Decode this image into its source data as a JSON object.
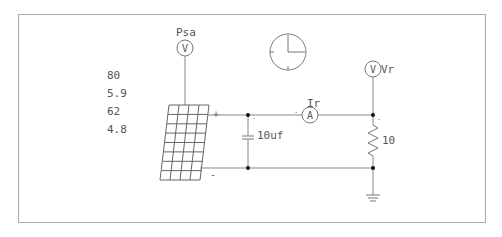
{
  "diagram": {
    "type": "circuit-schematic",
    "values_panel": [
      "80",
      "5.9",
      "62",
      "4.8"
    ],
    "components": {
      "solar_panel": {
        "plus_label": "+",
        "minus_label": "-"
      },
      "voltmeter_psa": {
        "letter": "V",
        "label": "Psa"
      },
      "voltmeter_vr": {
        "letter": "V",
        "label": "Vr"
      },
      "ammeter": {
        "letter": "A",
        "label": "Ir"
      },
      "capacitor": {
        "label": "10uf"
      },
      "resistor": {
        "label": "10"
      },
      "clock": {
        "label": ""
      },
      "ground": {
        "label": ""
      }
    },
    "colors": {
      "wire": "#888888",
      "border": "#aaaaaa",
      "text": "#555555",
      "node": "#111111"
    }
  }
}
